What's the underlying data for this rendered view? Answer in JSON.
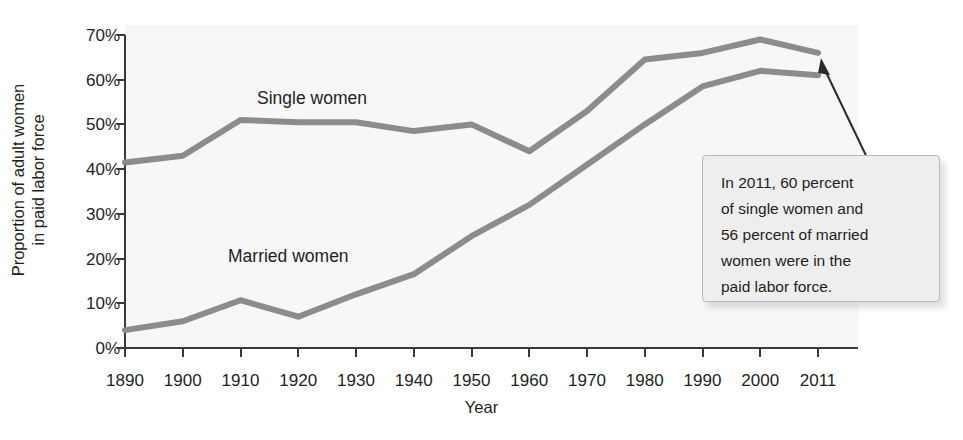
{
  "chart_data": {
    "type": "line",
    "title": "",
    "xlabel": "Year",
    "ylabel": "Proportion of adult women in paid labor force",
    "ylabel_line1": "Proportion of adult women",
    "ylabel_line2": "in paid labor force",
    "x": [
      1890,
      1900,
      1910,
      1920,
      1930,
      1940,
      1950,
      1960,
      1970,
      1980,
      1990,
      2000,
      2011
    ],
    "categories": [
      "1890",
      "1900",
      "1910",
      "1920",
      "1930",
      "1940",
      "1950",
      "1960",
      "1970",
      "1980",
      "1990",
      "2000",
      "2011"
    ],
    "xtick_labels": [
      "1890",
      "1900",
      "1910",
      "1920",
      "1930",
      "1940",
      "1950",
      "1960",
      "1970",
      "1980",
      "1990",
      "2000",
      "2011"
    ],
    "ytick_labels": [
      "0%",
      "10%",
      "20%",
      "30%",
      "40%",
      "50%",
      "60%",
      "70%"
    ],
    "ytick_values": [
      0,
      10,
      20,
      30,
      40,
      50,
      60,
      70
    ],
    "ylim": [
      0,
      70
    ],
    "xlim": [
      1890,
      2011
    ],
    "grid": false,
    "legend_position": "inline-labels",
    "series": [
      {
        "name": "Single women",
        "label": "Single women",
        "color": "#8c8c8c",
        "values": [
          41.5,
          43.0,
          51.0,
          50.5,
          50.5,
          48.5,
          50.0,
          44.0,
          53.0,
          64.5,
          66.0,
          69.0,
          66.0
        ]
      },
      {
        "name": "Married women",
        "label": "Married women",
        "color": "#8c8c8c",
        "values": [
          4.0,
          6.0,
          10.7,
          7.0,
          12.0,
          16.5,
          25.0,
          32.0,
          41.0,
          50.0,
          58.5,
          62.0,
          61.0
        ]
      }
    ],
    "annotations": [
      {
        "name": "callout-2011",
        "text": "In 2011, 60 percent of single women and 56 percent of married women were in the paid labor force.",
        "lines": [
          "In 2011, 60 percent",
          "of single women and",
          "56 percent of married",
          "women were in the",
          "paid labor force."
        ],
        "points_to_year": 2011
      }
    ],
    "colors": {
      "line": "#8c8c8c",
      "axis": "#3a3a3a",
      "text": "#231f20",
      "plot_background": "#f7f7f7",
      "callout_background": "#eeeeee",
      "callout_border": "#b9b9b9"
    }
  }
}
